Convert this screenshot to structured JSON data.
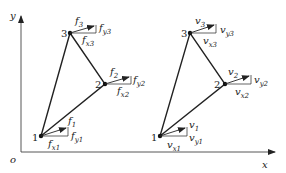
{
  "diagram": {
    "axes": {
      "origin_label": "o",
      "x_label": "x",
      "y_label": "y"
    },
    "left_triangle": {
      "nodes": [
        {
          "id": "1",
          "force": "f",
          "force_sub": "1",
          "fx": "f",
          "fx_sub": "x1",
          "fy": "f",
          "fy_sub": "y1"
        },
        {
          "id": "2",
          "force": "f",
          "force_sub": "2",
          "fx": "f",
          "fx_sub": "x2",
          "fy": "f",
          "fy_sub": "y2"
        },
        {
          "id": "3",
          "force": "f",
          "force_sub": "3",
          "fx": "f",
          "fx_sub": "x3",
          "fy": "f",
          "fy_sub": "y3"
        }
      ]
    },
    "right_triangle": {
      "nodes": [
        {
          "id": "1",
          "force": "v",
          "force_sub": "1",
          "fx": "v",
          "fx_sub": "x1",
          "fy": "v",
          "fy_sub": "y1"
        },
        {
          "id": "2",
          "force": "v",
          "force_sub": "2",
          "fx": "v",
          "fx_sub": "x2",
          "fy": "v",
          "fy_sub": "y2"
        },
        {
          "id": "3",
          "force": "v",
          "force_sub": "3",
          "fx": "v",
          "fx_sub": "x3",
          "fy": "v",
          "fy_sub": "y3"
        }
      ]
    },
    "colors": {
      "line": "#222222",
      "background": "#ffffff"
    }
  }
}
